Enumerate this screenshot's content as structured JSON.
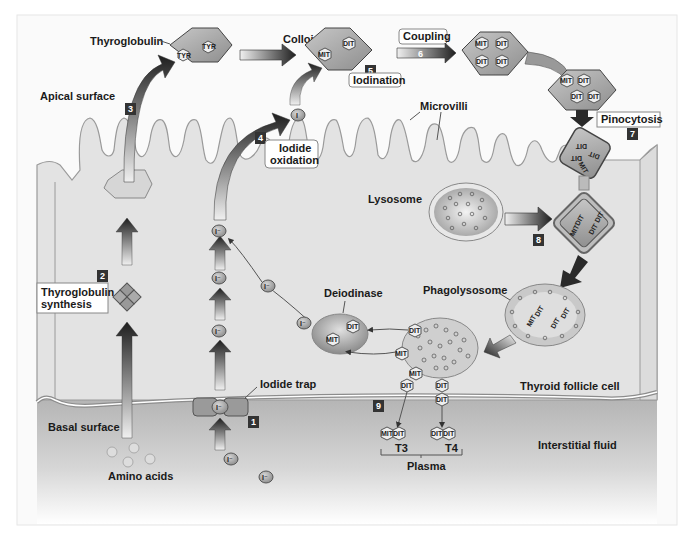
{
  "diagram": {
    "labels": {
      "thyroglobulin": "Thyroglobulin",
      "colloid": "Colloid",
      "apical_surface": "Apical surface",
      "microvilli": "Microvilli",
      "lysosome": "Lysosome",
      "phagolysosome": "Phagolysosome",
      "deiodinase": "Deiodinase",
      "iodide_trap": "Iodide trap",
      "thyroid_follicle_cell": "Thyroid follicle cell",
      "basal_surface": "Basal surface",
      "amino_acids": "Amino acids",
      "interstitial_fluid": "Interstitial fluid",
      "plasma": "Plasma",
      "t3": "T3",
      "t4": "T4"
    },
    "boxed_labels": {
      "coupling": "Coupling",
      "iodination": "Iodination",
      "iodide_oxidation_1": "Iodide",
      "iodide_oxidation_2": "oxidation",
      "pinocytosis": "Pinocytosis",
      "thyroglobulin_synthesis_1": "Thyroglobulin",
      "thyroglobulin_synthesis_2": "synthesis"
    },
    "steps": {
      "s1": "1",
      "s2": "2",
      "s3": "3",
      "s4": "4",
      "s5": "5",
      "s6": "6",
      "s7": "7",
      "s8": "8",
      "s9": "9"
    },
    "residues": {
      "tyr": "TYR",
      "mit": "MIT",
      "dit": "DIT"
    },
    "ions": {
      "iodide": "I⁻",
      "iodine": "I"
    },
    "colors": {
      "frame": "#e6e6e6",
      "cell": "#e2e2e2",
      "cell_stroke": "#9a9a9a",
      "fluid_top": "#b9b9b9",
      "fluid_bottom": "#ffffff",
      "diamond": "#a8a8a8",
      "step_box": "#333333",
      "arrow_dark": "#2a2a2a"
    }
  }
}
